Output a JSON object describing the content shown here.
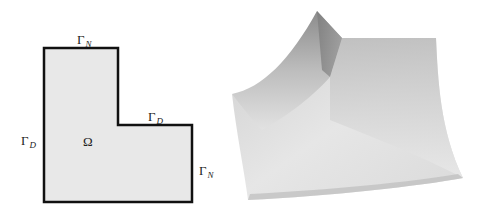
{
  "figure": {
    "left_panel": {
      "domain_label": "Ω",
      "boundary_labels": [
        {
          "id": "top",
          "symbol": "Γ",
          "subscript": "N"
        },
        {
          "id": "inner",
          "symbol": "Γ",
          "subscript": "D"
        },
        {
          "id": "left",
          "symbol": "Γ",
          "subscript": "D"
        },
        {
          "id": "right",
          "symbol": "Γ",
          "subscript": "N"
        }
      ],
      "fill_color": "#e8e8e8",
      "stroke_color": "#111111"
    },
    "right_panel": {
      "description": "3D surface plot of solution over L-shaped domain",
      "surface_color_light": "#e6e6e6",
      "surface_color_dark": "#8a8a8a"
    }
  }
}
